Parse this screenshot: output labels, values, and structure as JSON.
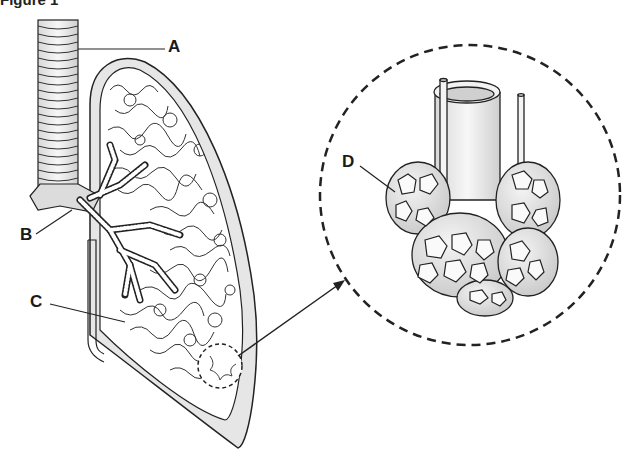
{
  "figure": {
    "title": "Figure 1",
    "labels": {
      "A": "A",
      "B": "B",
      "C": "C",
      "D": "D"
    },
    "colors": {
      "line": "#222222",
      "fill_gray": "#e3e3e3",
      "fill_white": "#ffffff"
    }
  }
}
